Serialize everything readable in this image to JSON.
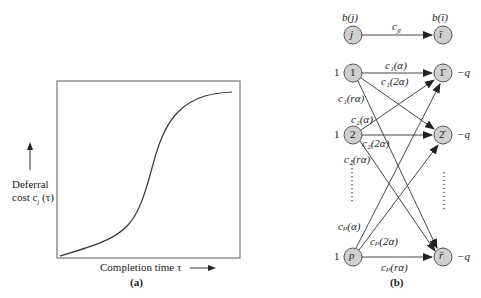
{
  "panel_a": {
    "label": "(a)",
    "y_axis_label_line1": "Deferral",
    "y_axis_label_line2": "cost c",
    "y_axis_label_sub": "j",
    "y_axis_label_arg": "(τ)",
    "x_axis_label": "Completion time τ",
    "curve": "monotonically increasing S-shaped curve (convex then concave)"
  },
  "panel_b": {
    "label": "(b)",
    "legend": {
      "source_supply": "b(j)",
      "source_node": "j",
      "sink_supply": "b(ī)",
      "sink_node": "ī",
      "arc_cost": "c",
      "arc_cost_sub": "jī"
    },
    "left_nodes": [
      {
        "id": "1",
        "supply": "1"
      },
      {
        "id": "2",
        "supply": "1"
      },
      {
        "id": "p",
        "supply": "1"
      }
    ],
    "right_nodes": [
      {
        "id": "1̄",
        "demand": "−q"
      },
      {
        "id": "2̄",
        "demand": "−q"
      },
      {
        "id": "r̄",
        "demand": "−q"
      }
    ],
    "arc_labels": {
      "c1_a": "c₁(α)",
      "c1_2a": "c₁(2α)",
      "c1_ra": "c₁(rα)",
      "c2_a": "c₂(α)",
      "c2_2a": "c₂(2α)",
      "c2_ra": "c₂(rα)",
      "cp_a": "cₚ(α)",
      "cp_2a": "cₚ(2α)",
      "cp_ra": "cₚ(rα)"
    }
  }
}
